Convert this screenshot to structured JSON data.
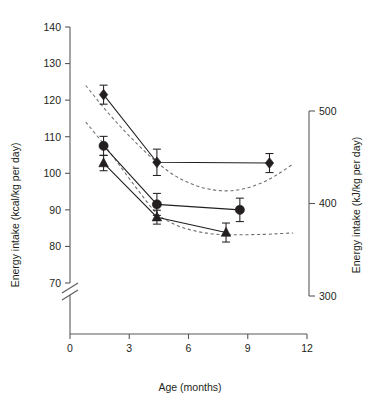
{
  "chart_data": {
    "type": "line",
    "title": "",
    "subtitle": "",
    "xlabel": "Age (months)",
    "ylabel": "Energy intake (kcal/kg per day)",
    "ylabel_right": "Energy intake (kJ/kg per day)",
    "xlim": [
      0,
      12
    ],
    "ylim": [
      65,
      140
    ],
    "ylim_right": [
      300,
      520
    ],
    "grid": false,
    "legend_position": "none",
    "axis_break": true,
    "xticks": [
      0,
      3,
      6,
      9,
      12
    ],
    "xtick_labels": [
      "0",
      "3",
      "6",
      "9",
      "12"
    ],
    "yticks": [
      70,
      80,
      90,
      100,
      110,
      120,
      130,
      140
    ],
    "ytick_labels": [
      "70",
      "80",
      "90",
      "100",
      "110",
      "120",
      "130",
      "140"
    ],
    "yticks_right": [
      300,
      400,
      500
    ],
    "ytick_labels_right": [
      "300",
      "400",
      "500"
    ],
    "series": [
      {
        "name": "diamond-series",
        "marker": "diamond",
        "linestyle": "solid",
        "x": [
          1.7,
          4.4,
          10.1
        ],
        "values": [
          121.5,
          103.0,
          102.8
        ],
        "errors": [
          2.6,
          3.6,
          2.6
        ]
      },
      {
        "name": "circle-series",
        "marker": "circle",
        "linestyle": "solid",
        "x": [
          1.7,
          4.4,
          8.6
        ],
        "values": [
          107.5,
          91.5,
          90.0
        ],
        "errors": [
          2.6,
          3.0,
          3.2
        ]
      },
      {
        "name": "triangle-series",
        "marker": "triangle",
        "linestyle": "solid",
        "x": [
          1.7,
          4.4,
          7.9
        ],
        "values": [
          102.8,
          88.0,
          83.8
        ],
        "errors": [
          2.1,
          1.9,
          2.6
        ]
      }
    ],
    "reference_curves": [
      {
        "name": "upper-reference-curve",
        "linestyle": "dashed",
        "x": [
          0.8,
          1.7,
          2.6,
          3.5,
          4.4,
          5.3,
          6.2,
          7.1,
          8.0,
          8.9,
          9.8,
          10.6,
          11.3
        ],
        "values": [
          124.0,
          118.0,
          112.5,
          107.5,
          103.0,
          99.4,
          97.0,
          95.6,
          95.2,
          95.9,
          97.6,
          100.0,
          102.6
        ]
      },
      {
        "name": "lower-reference-curve",
        "linestyle": "dashed",
        "x": [
          0.8,
          1.7,
          2.6,
          3.5,
          4.4,
          5.3,
          6.2,
          7.1,
          8.0,
          8.9,
          9.8,
          10.6,
          11.3
        ],
        "values": [
          114.0,
          108.0,
          101.5,
          95.0,
          89.0,
          86.0,
          84.4,
          83.5,
          83.2,
          83.2,
          83.3,
          83.5,
          83.7
        ]
      }
    ]
  },
  "axes": {
    "left_title": "Energy intake (kcal/kg per day)",
    "right_title": "Energy intake (kJ/kg per day)",
    "x_title": "Age (months)"
  },
  "colors": {
    "marker": "#231f20",
    "axis": "#58595b",
    "reference": "#6d6e71",
    "background": "#ffffff"
  }
}
